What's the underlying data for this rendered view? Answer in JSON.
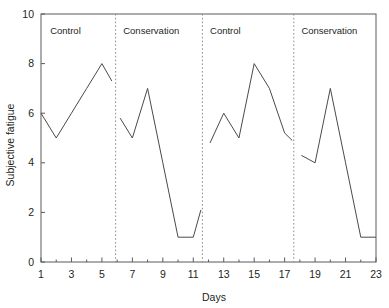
{
  "chart_data": {
    "type": "line",
    "title": "",
    "xlabel": "Days",
    "ylabel": "Subjective fatigue",
    "xlim": [
      1,
      23
    ],
    "ylim": [
      0,
      10
    ],
    "grid": false,
    "legend": "none",
    "x_ticks": [
      1,
      3,
      5,
      7,
      9,
      11,
      13,
      15,
      17,
      19,
      21,
      23
    ],
    "x_tick_labels": [
      "1",
      "3",
      "5",
      "7",
      "9",
      "11",
      "13",
      "15",
      "17",
      "19",
      "21",
      "23"
    ],
    "x_minor_ticks": [
      2,
      4,
      6,
      8,
      10,
      12,
      14,
      16,
      18,
      20,
      22
    ],
    "y_ticks": [
      0,
      2,
      4,
      6,
      8,
      10
    ],
    "y_tick_labels": [
      "0",
      "2",
      "4",
      "6",
      "8",
      "10"
    ],
    "line_color": "#4a4a4a",
    "phases": [
      {
        "label": "Control",
        "x_start": 1,
        "x_end": 5.9,
        "label_x": 1.6
      },
      {
        "label": "Conservation",
        "x_start": 5.9,
        "x_end": 11.6,
        "label_x": 6.4
      },
      {
        "label": "Control",
        "x_start": 11.6,
        "x_end": 17.6,
        "label_x": 12.1
      },
      {
        "label": "Conservation",
        "x_start": 17.6,
        "x_end": 23,
        "label_x": 18.1
      }
    ],
    "dividers": [
      5.9,
      11.6,
      17.6
    ],
    "series": [
      {
        "name": "Control phase 1",
        "x": [
          1,
          2,
          3,
          4,
          5,
          5.65
        ],
        "values": [
          6,
          5,
          6,
          7,
          8,
          7.3
        ]
      },
      {
        "name": "Conservation phase 1",
        "x": [
          6.2,
          7,
          8,
          9,
          10,
          11,
          11.5
        ],
        "values": [
          5.8,
          5,
          7,
          4,
          1,
          1,
          2.1
        ]
      },
      {
        "name": "Control phase 2",
        "x": [
          12.1,
          13,
          14,
          15,
          16,
          17,
          17.5
        ],
        "values": [
          4.8,
          6,
          5,
          8,
          7,
          5.2,
          4.9
        ]
      },
      {
        "name": "Conservation phase 2",
        "x": [
          18.1,
          19,
          20,
          21,
          22,
          23
        ],
        "values": [
          4.3,
          4,
          7,
          4,
          1,
          1
        ]
      }
    ]
  }
}
